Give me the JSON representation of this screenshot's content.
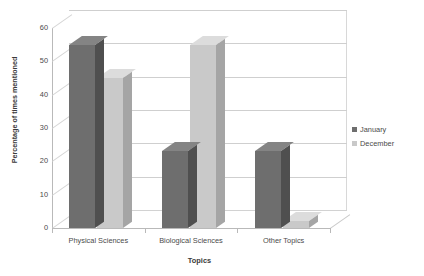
{
  "chart_data": {
    "type": "bar",
    "title": "",
    "xlabel": "Topics",
    "ylabel": "Percentage of times mentioned",
    "categories": [
      "Physical Sciences",
      "Biological Sciences",
      "Other Topics"
    ],
    "series": [
      {
        "name": "January",
        "color": "#6e6e6e",
        "values": [
          55,
          23,
          23
        ]
      },
      {
        "name": "December",
        "color": "#c9c9c9",
        "values": [
          45,
          55,
          2
        ]
      }
    ],
    "ylim": [
      0,
      60
    ],
    "yticks": [
      0,
      10,
      20,
      30,
      40,
      50,
      60
    ],
    "ytick_labels": [
      "0",
      "10",
      "20",
      "30",
      "40",
      "50",
      "60"
    ],
    "grid": true,
    "grid_axis": "y",
    "legend_position": "right",
    "style": "3d-column"
  }
}
